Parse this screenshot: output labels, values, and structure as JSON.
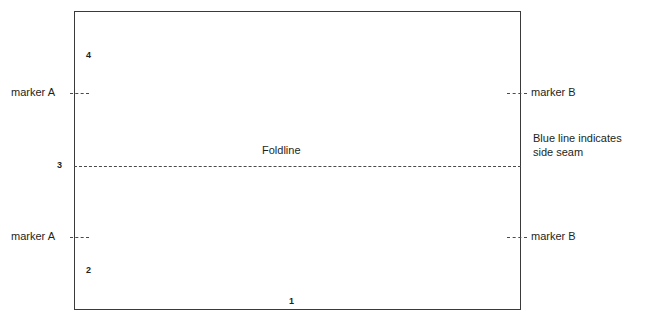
{
  "diagram": {
    "rect": {
      "name": "pattern-piece-outline",
      "stroke_color": "#3a3a3a"
    },
    "foldline": {
      "label": "Foldline",
      "line_color": "#4a4a4a",
      "style": "dashed"
    },
    "markers": {
      "a_top": "marker A",
      "a_bottom": "marker A",
      "b_top": "marker B",
      "b_bottom": "marker B",
      "tick_color": "#4a4a4a"
    },
    "seam_note": {
      "line1": "Blue line indicates",
      "line2": "side seam"
    },
    "edge_numbers": {
      "top_left": "4",
      "mid_left": "3",
      "lower_left": "2",
      "bottom": "1"
    }
  }
}
